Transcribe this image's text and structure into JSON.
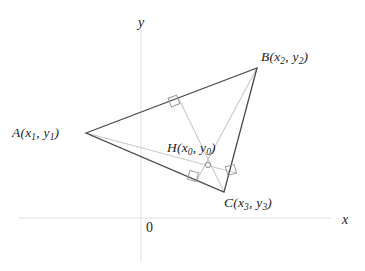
{
  "figure": {
    "kind": "geometry-diagram",
    "width": 365,
    "height": 271,
    "background_color": "#ffffff"
  },
  "colors": {
    "triangle_stroke": "#4a4a4a",
    "altitude_stroke": "#c9c9c9",
    "axis_stroke": "#e2e2e2",
    "right_angle_stroke": "#9a9a9a",
    "marker_stroke": "#8a8a8a",
    "text": "#1c1c1c"
  },
  "axes": {
    "x_axis": {
      "label": "x",
      "label_x": 342,
      "label_y": 213,
      "y": 218,
      "x_start": 18,
      "x_end": 331
    },
    "y_axis": {
      "label": "y",
      "label_x": 138,
      "label_y": 16,
      "x": 141,
      "y_start": 30,
      "y_end": 262
    },
    "origin": {
      "label": "0",
      "label_x": 146,
      "label_y": 221
    }
  },
  "points": [
    {
      "id": "A",
      "letter": "A",
      "coord_text": "(x1, y1)",
      "x_sub": "1",
      "y_sub": "1",
      "px": 86,
      "py": 133,
      "label_x": 12,
      "label_y": 126,
      "marker": false
    },
    {
      "id": "B",
      "letter": "B",
      "coord_text": "(x2, y2)",
      "x_sub": "2",
      "y_sub": "2",
      "px": 257,
      "py": 68,
      "label_x": 261,
      "label_y": 50,
      "marker": false
    },
    {
      "id": "C",
      "letter": "C",
      "coord_text": "(x3, y3)",
      "x_sub": "3",
      "y_sub": "3",
      "px": 224,
      "py": 192,
      "label_x": 224,
      "label_y": 196,
      "marker": false
    },
    {
      "id": "H",
      "letter": "H",
      "coord_text": "(x0, y0)",
      "x_sub": "0",
      "y_sub": "0",
      "px": 208,
      "py": 165,
      "label_x": 167,
      "label_y": 141,
      "marker": true,
      "marker_radius": 2.6
    }
  ],
  "triangle": {
    "name": "triangle-ABC",
    "vertices": [
      [
        86,
        133
      ],
      [
        257,
        68
      ],
      [
        224,
        192
      ]
    ],
    "stroke_width": 1.3
  },
  "altitudes": [
    {
      "id": "altitude-from-A",
      "from": [
        86,
        133
      ],
      "to": [
        236,
        173
      ],
      "foot": [
        236,
        173
      ],
      "opposite_side": "BC"
    },
    {
      "id": "altitude-from-B",
      "from": [
        257,
        68
      ],
      "to": [
        197,
        180
      ],
      "foot": [
        197,
        180
      ],
      "opposite_side": "AC"
    },
    {
      "id": "altitude-from-C",
      "from": [
        224,
        192
      ],
      "to": [
        178,
        97
      ],
      "foot": [
        178,
        97
      ],
      "opposite_side": "AB"
    }
  ],
  "right_angle_marks": [
    {
      "id": "right-angle-on-AB",
      "cx": 174,
      "cy": 101,
      "size": 9,
      "rotation": -21
    },
    {
      "id": "right-angle-on-AC",
      "cx": 193,
      "cy": 176,
      "size": 9,
      "rotation": 17
    },
    {
      "id": "right-angle-on-BC",
      "cx": 231,
      "cy": 170,
      "size": 9,
      "rotation": 75
    }
  ]
}
